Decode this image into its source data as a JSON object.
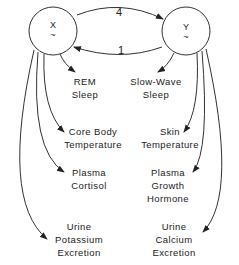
{
  "diagram": {
    "oscillators": [
      {
        "id": "x",
        "label": "X",
        "symbol": "~"
      },
      {
        "id": "y",
        "label": "Y",
        "symbol": "~"
      }
    ],
    "coupling": [
      {
        "from": "X",
        "to": "Y",
        "strength": "4"
      },
      {
        "from": "Y",
        "to": "X",
        "strength": "1"
      }
    ],
    "x_outputs": [
      {
        "line1": "REM",
        "line2": "Sleep"
      },
      {
        "line1": "Core Body",
        "line2": "Temperature"
      },
      {
        "line1": "Plasma",
        "line2": "Cortisol"
      },
      {
        "line1": "Urine",
        "line2": "Potassium",
        "line3": "Excretion"
      }
    ],
    "y_outputs": [
      {
        "line1": "Slow-Wave",
        "line2": "Sleep"
      },
      {
        "line1": "Skin",
        "line2": "Temperature"
      },
      {
        "line1": "Plasma",
        "line2": "Growth",
        "line3": "Hormone"
      },
      {
        "line1": "Urine",
        "line2": "Calcium",
        "line3": "Excretion"
      }
    ]
  }
}
